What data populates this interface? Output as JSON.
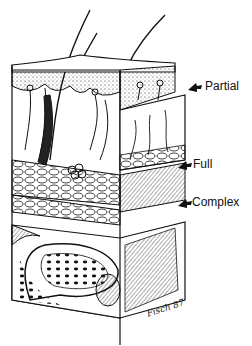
{
  "figure": {
    "labels": [
      {
        "text": "Partial",
        "x": 205,
        "y": 80
      },
      {
        "text": "Full",
        "x": 193,
        "y": 158
      },
      {
        "text": "Complex",
        "x": 192,
        "y": 196
      }
    ],
    "signature": "Fisch 87",
    "colors": {
      "ink": "#111111",
      "background": "#ffffff"
    }
  }
}
